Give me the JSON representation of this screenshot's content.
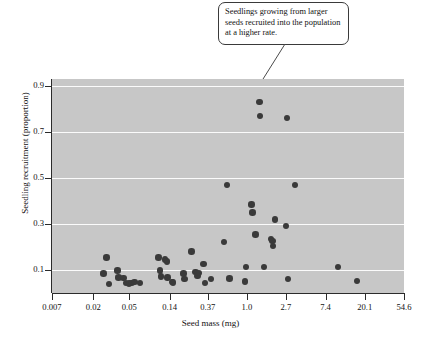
{
  "annotation": {
    "callout_text": "Seedlings growing from larger seeds recruited into the population at a higher rate.",
    "leader_from": [
      252,
      44
    ],
    "leader_to": [
      286,
      96
    ]
  },
  "colors": {
    "plot_background": "#c7c7c7",
    "gridline": "#fbfbfb",
    "point_fill": "#3a3a3a",
    "axis": "#2b2b2b",
    "text": "#111111",
    "callout_border": "#3a3a3a",
    "page_background": "#ffffff"
  },
  "chart_data": {
    "type": "scatter",
    "title": "",
    "xlabel": "Seed mass (mg)",
    "ylabel": "Seedling recruitment (proportion)",
    "x_scale": "log",
    "x_tick_labels": [
      "0.007",
      "0.02",
      "0.05",
      "0.14",
      "0.37",
      "1.0",
      "2.7",
      "7.4",
      "20.1",
      "54.6"
    ],
    "x_tick_values": [
      0.007,
      0.02,
      0.05,
      0.14,
      0.37,
      1.0,
      2.7,
      7.4,
      20.1,
      54.6
    ],
    "xlim": [
      0.007,
      54.6
    ],
    "y_tick_labels": [
      "0.1",
      "0.3",
      "0.5",
      "0.7",
      "0.9"
    ],
    "y_tick_values": [
      0.1,
      0.3,
      0.5,
      0.7,
      0.9
    ],
    "ylim": [
      0.0,
      0.93
    ],
    "grid": "horizontal",
    "legend": "none",
    "points": [
      {
        "x": 0.026,
        "y": 0.085
      },
      {
        "x": 0.028,
        "y": 0.155
      },
      {
        "x": 0.03,
        "y": 0.04
      },
      {
        "x": 0.037,
        "y": 0.097
      },
      {
        "x": 0.038,
        "y": 0.067
      },
      {
        "x": 0.043,
        "y": 0.066
      },
      {
        "x": 0.046,
        "y": 0.043
      },
      {
        "x": 0.05,
        "y": 0.042
      },
      {
        "x": 0.053,
        "y": 0.044
      },
      {
        "x": 0.057,
        "y": 0.047
      },
      {
        "x": 0.066,
        "y": 0.043
      },
      {
        "x": 0.105,
        "y": 0.155
      },
      {
        "x": 0.11,
        "y": 0.098
      },
      {
        "x": 0.112,
        "y": 0.071
      },
      {
        "x": 0.125,
        "y": 0.145
      },
      {
        "x": 0.13,
        "y": 0.137
      },
      {
        "x": 0.132,
        "y": 0.068
      },
      {
        "x": 0.148,
        "y": 0.048
      },
      {
        "x": 0.152,
        "y": 0.046
      },
      {
        "x": 0.2,
        "y": 0.085
      },
      {
        "x": 0.205,
        "y": 0.06
      },
      {
        "x": 0.245,
        "y": 0.18
      },
      {
        "x": 0.27,
        "y": 0.092
      },
      {
        "x": 0.285,
        "y": 0.075
      },
      {
        "x": 0.295,
        "y": 0.088
      },
      {
        "x": 0.33,
        "y": 0.125
      },
      {
        "x": 0.345,
        "y": 0.043
      },
      {
        "x": 0.4,
        "y": 0.06
      },
      {
        "x": 0.56,
        "y": 0.222
      },
      {
        "x": 0.6,
        "y": 0.47
      },
      {
        "x": 0.64,
        "y": 0.063
      },
      {
        "x": 0.95,
        "y": 0.05
      },
      {
        "x": 0.98,
        "y": 0.113
      },
      {
        "x": 1.12,
        "y": 0.385
      },
      {
        "x": 1.15,
        "y": 0.35
      },
      {
        "x": 1.25,
        "y": 0.255
      },
      {
        "x": 1.38,
        "y": 0.83
      },
      {
        "x": 1.4,
        "y": 0.77
      },
      {
        "x": 1.55,
        "y": 0.113
      },
      {
        "x": 1.85,
        "y": 0.235
      },
      {
        "x": 1.92,
        "y": 0.225
      },
      {
        "x": 1.95,
        "y": 0.205
      },
      {
        "x": 2.05,
        "y": 0.32
      },
      {
        "x": 2.7,
        "y": 0.29
      },
      {
        "x": 2.78,
        "y": 0.76
      },
      {
        "x": 2.85,
        "y": 0.06
      },
      {
        "x": 3.4,
        "y": 0.47
      },
      {
        "x": 10.2,
        "y": 0.113
      },
      {
        "x": 16.5,
        "y": 0.052
      }
    ]
  }
}
